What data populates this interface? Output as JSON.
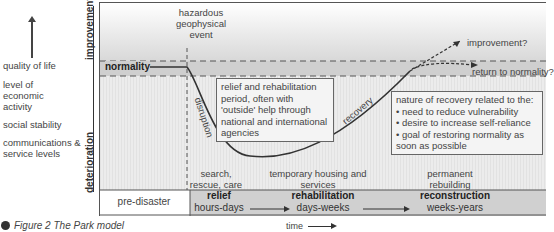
{
  "left_indicators": {
    "arrow": "up-arrow",
    "items": [
      "quality of life",
      "level of economic activity",
      "social stability",
      "communications & service levels"
    ]
  },
  "axis": {
    "y_top": "improvement",
    "y_bottom": "deterioration",
    "x_label": "time"
  },
  "labels": {
    "event": "hazardous geophysical event",
    "normality": "normality",
    "improvement_q": "improvement?",
    "return_q": "return to normality?",
    "disruption": "disruption",
    "recovery": "recovery"
  },
  "boxes": {
    "relief_text": "relief and rehabilitation period, often with 'outside' help through national and international agencies",
    "nature_title": "nature of recovery related to the:",
    "nature_items": [
      "need to reduce vulnerability",
      "desire to increase self-reliance",
      "goal of restoring normality as soon as possible"
    ]
  },
  "activities": {
    "search": "search, rescue, care",
    "temporary": "temporary housing and services",
    "permanent": "permanent rebuilding"
  },
  "phases": {
    "pre": "pre-disaster",
    "relief": {
      "name": "relief",
      "duration": "hours-days"
    },
    "rehab": {
      "name": "rehabilitation",
      "duration": "days-weeks"
    },
    "recon": {
      "name": "reconstruction",
      "duration": "weeks-years"
    }
  },
  "caption": "Figure 2 The Park model"
}
